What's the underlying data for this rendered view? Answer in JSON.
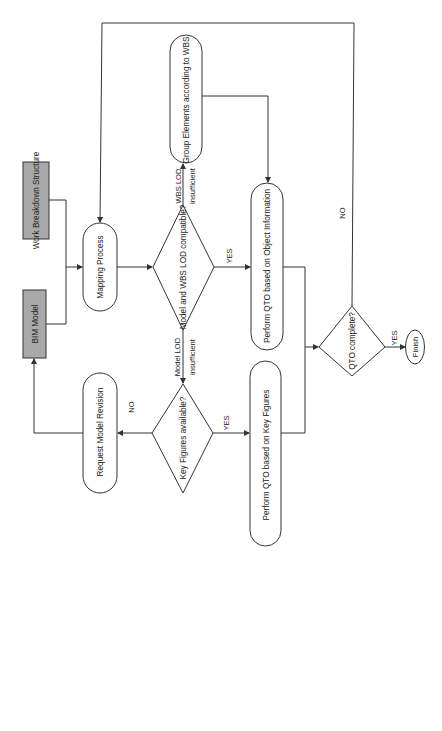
{
  "diagram": {
    "orientation": "rotated-90-ccw",
    "colors": {
      "line": "#333333",
      "input_fill": "#a9a9a9",
      "node_fill": "#ffffff",
      "background": "#ffffff"
    },
    "nodes": {
      "bim_model": {
        "label": "BIM Model",
        "type": "input"
      },
      "wbs": {
        "label": "Work Breakdown Structure",
        "type": "input"
      },
      "mapping": {
        "label": "Mapping Process",
        "type": "process"
      },
      "lod_compatible": {
        "label": "Model and WBS LOD compatible?",
        "type": "decision"
      },
      "group_elements": {
        "label": "Group Elements according to WBS",
        "type": "process"
      },
      "qto_object": {
        "label": "Perform QTO based on Object Information",
        "type": "process"
      },
      "key_figures": {
        "label": "Key Figures available?",
        "type": "decision"
      },
      "request_revision": {
        "label": "Request Model Revision",
        "type": "process"
      },
      "qto_key_figures": {
        "label": "Perform QTO based on Key Figures",
        "type": "process"
      },
      "qto_complete": {
        "label": "QTO complete?",
        "type": "decision"
      },
      "finish": {
        "label": "Finish",
        "type": "terminal"
      }
    },
    "edge_labels": {
      "wbs_lod_1": "WBS LOD",
      "wbs_lod_2": "insufficient",
      "model_lod_1": "Model LOD",
      "model_lod_2": "insufficient",
      "lod_yes": "YES",
      "kf_yes": "YES",
      "kf_no": "NO",
      "qto_yes": "YES",
      "qto_no": "NO"
    }
  }
}
